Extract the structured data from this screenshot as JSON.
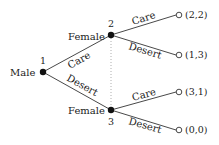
{
  "diagram": {
    "type": "extensive-form game tree",
    "nodes": [
      {
        "id": "1",
        "player": "Male",
        "label": "1",
        "x": 43,
        "y": 72
      },
      {
        "id": "2",
        "player": "Female",
        "label": "2",
        "x": 111,
        "y": 35
      },
      {
        "id": "3",
        "player": "Female",
        "label": "3",
        "x": 111,
        "y": 110
      }
    ],
    "edges": [
      {
        "from": "1",
        "to": "2",
        "action": "Care"
      },
      {
        "from": "1",
        "to": "3",
        "action": "Desert"
      },
      {
        "from": "2",
        "to": "t1",
        "action": "Care"
      },
      {
        "from": "2",
        "to": "t2",
        "action": "Desert"
      },
      {
        "from": "3",
        "to": "t3",
        "action": "Care"
      },
      {
        "from": "3",
        "to": "t4",
        "action": "Desert"
      }
    ],
    "terminals": [
      {
        "id": "t1",
        "payoff": "(2,2)",
        "x": 179,
        "y": 15
      },
      {
        "id": "t2",
        "payoff": "(1,3)",
        "x": 179,
        "y": 55
      },
      {
        "id": "t3",
        "payoff": "(3,1)",
        "x": 179,
        "y": 92
      },
      {
        "id": "t4",
        "payoff": "(0,0)",
        "x": 179,
        "y": 130
      }
    ],
    "information_set": {
      "nodes": [
        "2",
        "3"
      ],
      "style": "dotted"
    },
    "labels": {
      "male": "Male",
      "female_top": "Female",
      "female_bottom": "Female",
      "node1": "1",
      "node2": "2",
      "node3": "3",
      "care_1": "Care",
      "desert_1": "Desert",
      "care_2": "Care",
      "desert_2": "Desert",
      "care_3": "Care",
      "desert_3": "Desert",
      "payoff_1": "(2,2)",
      "payoff_2": "(1,3)",
      "payoff_3": "(3,1)",
      "payoff_4": "(0,0)"
    }
  }
}
